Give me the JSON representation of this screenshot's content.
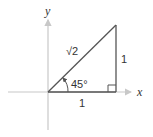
{
  "diagram": {
    "type": "right-triangle-unit",
    "axes": {
      "x_label": "x",
      "y_label": "y"
    },
    "labels": {
      "hypotenuse": "√2",
      "vertical_side": "1",
      "horizontal_side": "1",
      "angle": "45°"
    },
    "colors": {
      "axis": "#c8c8c8",
      "triangle": "#555555",
      "text": "#333333"
    }
  }
}
